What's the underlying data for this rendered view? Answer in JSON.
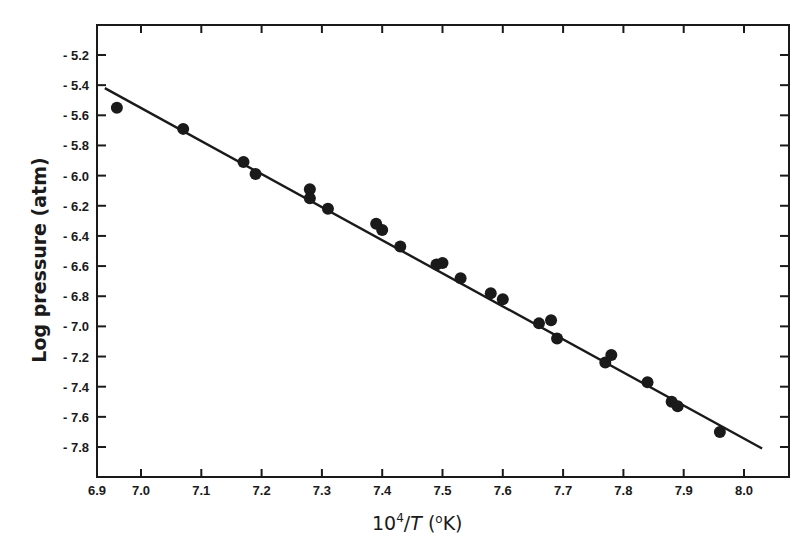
{
  "chart_data": {
    "type": "scatter",
    "title": "",
    "xlabel": "10⁴/T (°K)",
    "xlabel_parts": {
      "base": "10",
      "sup": "4",
      "slash": "/",
      "var": "T",
      "unit_open": " (",
      "unit_sup": "o",
      "unit": "K)"
    },
    "ylabel": "Log pressure  (atm)",
    "xlim": [
      6.926,
      8.075
    ],
    "ylim": [
      -8.0,
      -5.0
    ],
    "grid": false,
    "legend": null,
    "x_ticks": [
      7.0,
      7.1,
      7.2,
      7.3,
      7.4,
      7.5,
      7.6,
      7.7,
      7.8,
      7.9,
      8.0
    ],
    "x_tick_labels": [
      "6.9",
      "7.0",
      "7.1",
      "7.2",
      "7.3",
      "7.4",
      "7.5",
      "7.6",
      "7.7",
      "7.8",
      "7.9",
      "8.0"
    ],
    "y_ticks": [
      -5.2,
      -5.4,
      -5.6,
      -5.8,
      -6.0,
      -6.2,
      -6.4,
      -6.6,
      -6.8,
      -7.0,
      -7.2,
      -7.4,
      -7.6,
      -7.8
    ],
    "y_tick_labels": [
      "- 5.2",
      "- 5.4",
      "- 5.6",
      "- 5.8",
      "- 6.0",
      "- 6.2",
      "- 6.4",
      "- 6.6",
      "- 6.8",
      "- 7.0",
      "- 7.2",
      "- 7.4",
      "- 7.6",
      "- 7.8"
    ],
    "series": [
      {
        "name": "measured",
        "marker": "filled-circle",
        "x": [
          6.96,
          7.07,
          7.17,
          7.19,
          7.28,
          7.28,
          7.31,
          7.39,
          7.4,
          7.43,
          7.49,
          7.5,
          7.53,
          7.58,
          7.6,
          7.66,
          7.68,
          7.69,
          7.77,
          7.78,
          7.84,
          7.88,
          7.89,
          7.96
        ],
        "y": [
          -5.55,
          -5.69,
          -5.91,
          -5.99,
          -6.09,
          -6.15,
          -6.22,
          -6.32,
          -6.36,
          -6.47,
          -6.59,
          -6.58,
          -6.68,
          -6.78,
          -6.82,
          -6.98,
          -6.96,
          -7.08,
          -7.24,
          -7.19,
          -7.37,
          -7.5,
          -7.53,
          -7.7
        ]
      },
      {
        "name": "linear fit",
        "type": "line",
        "x": [
          6.94,
          8.03
        ],
        "y": [
          -5.42,
          -7.81
        ]
      }
    ]
  },
  "style": {
    "ink": "#1a1a1a",
    "background": "#ffffff"
  }
}
